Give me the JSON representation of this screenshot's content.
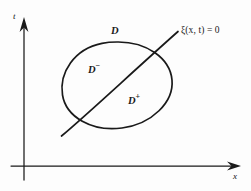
{
  "figure": {
    "type": "math-diagram",
    "background_color": "#fdfdfd",
    "ink_color": "#1a1a1a",
    "axes": {
      "vertical_axis_label": "t",
      "horizontal_axis_label": "x",
      "origin_px": [
        24,
        166
      ],
      "vertical_axis_top_px": [
        24,
        18
      ],
      "horizontal_axis_right_px": [
        240,
        166
      ],
      "arrowheads": [
        "vertical-up",
        "horizontal-right"
      ]
    },
    "domain_boundary": {
      "shape": "ellipse",
      "label": "D",
      "center_px": [
        117,
        85
      ],
      "radius_x_px": 55,
      "radius_y_px": 43,
      "rotation_deg": -8
    },
    "interface_curve": {
      "label_text": "ξ(x, t) = 0",
      "label_symbol": "ξ",
      "label_args": "(x, t)",
      "label_equals": "= 0",
      "start_px": [
        62,
        135
      ],
      "end_px": [
        178,
        32
      ],
      "orientation": "diagonal-up-right"
    },
    "regions": [
      {
        "name": "D-minus",
        "label_base": "D",
        "label_sup": "−",
        "position_px": [
          88,
          62
        ],
        "side": "upper-left"
      },
      {
        "name": "D-plus",
        "label_base": "D",
        "label_sup": "+",
        "position_px": [
          128,
          93
        ],
        "side": "lower-right"
      }
    ]
  }
}
